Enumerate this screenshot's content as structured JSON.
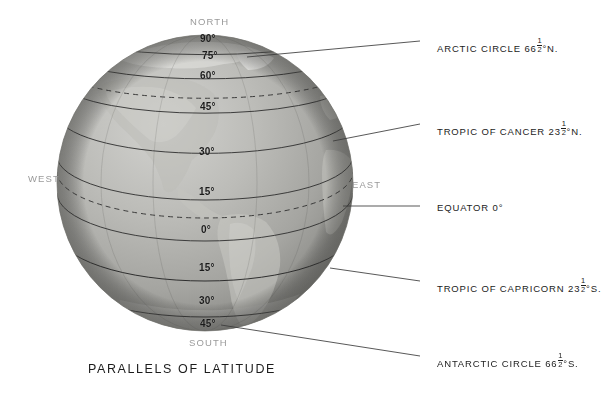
{
  "figure": {
    "caption": "PARALLELS OF LATITUDE"
  },
  "cardinals": [
    {
      "name": "north",
      "label": "NORTH",
      "x": 190,
      "y": 16
    },
    {
      "name": "south",
      "label": "SOUTH",
      "x": 189,
      "y": 337
    },
    {
      "name": "west",
      "label": "WEST",
      "x": 28,
      "y": 173
    },
    {
      "name": "east",
      "label": "EAST",
      "x": 352,
      "y": 179
    }
  ],
  "latitude_labels": [
    {
      "value": "90°",
      "x": 200,
      "y": 33,
      "hemisphere": "north"
    },
    {
      "value": "75°",
      "x": 202,
      "y": 50,
      "hemisphere": "north"
    },
    {
      "value": "60°",
      "x": 200,
      "y": 70,
      "hemisphere": "north"
    },
    {
      "value": "45°",
      "x": 200,
      "y": 101,
      "hemisphere": "north"
    },
    {
      "value": "30°",
      "x": 199,
      "y": 146,
      "hemisphere": "north"
    },
    {
      "value": "15°",
      "x": 199,
      "y": 186,
      "hemisphere": "north"
    },
    {
      "value": "0°",
      "x": 201,
      "y": 224,
      "hemisphere": "equator"
    },
    {
      "value": "15°",
      "x": 199,
      "y": 262,
      "hemisphere": "south"
    },
    {
      "value": "30°",
      "x": 199,
      "y": 295,
      "hemisphere": "south"
    },
    {
      "value": "45°",
      "x": 200,
      "y": 318,
      "hemisphere": "south"
    }
  ],
  "callouts": [
    {
      "name": "arctic-circle",
      "text_before": "ARCTIC CIRCLE 66",
      "fraction_num": "1",
      "fraction_den": "2",
      "text_after": "°N.",
      "x": 437,
      "y": 37,
      "leader": {
        "x1": 420,
        "y1": 41,
        "x2": 247,
        "y2": 57
      }
    },
    {
      "name": "tropic-of-cancer",
      "text_before": "TROPIC OF CANCER 23",
      "fraction_num": "1",
      "fraction_den": "2",
      "text_after": "°N.",
      "x": 437,
      "y": 120,
      "leader": {
        "x1": 420,
        "y1": 124,
        "x2": 333,
        "y2": 141
      }
    },
    {
      "name": "equator",
      "text_before": "EQUATOR 0°",
      "fraction_num": "",
      "fraction_den": "",
      "text_after": "",
      "x": 437,
      "y": 202,
      "leader": {
        "x1": 420,
        "y1": 206,
        "x2": 343,
        "y2": 206
      }
    },
    {
      "name": "tropic-of-capricorn",
      "text_before": "TROPIC OF CAPRICORN 23",
      "fraction_num": "1",
      "fraction_den": "2",
      "text_after": "°S.",
      "x": 437,
      "y": 277,
      "leader": {
        "x1": 420,
        "y1": 281,
        "x2": 330,
        "y2": 268
      }
    },
    {
      "name": "antarctic-circle",
      "text_before": "ANTARCTIC CIRCLE 66",
      "fraction_num": "1",
      "fraction_den": "2",
      "text_after": "°S.",
      "x": 437,
      "y": 352,
      "leader": {
        "x1": 420,
        "y1": 356,
        "x2": 221,
        "y2": 325
      }
    }
  ],
  "chart_data": {
    "type": "diagram",
    "title": "PARALLELS OF LATITUDE",
    "globe": {
      "center_x": 205,
      "center_y": 183,
      "radius": 148,
      "projection": "orthographic",
      "view": "western-hemisphere"
    },
    "parallels": [
      {
        "latitude": 90,
        "label": "90°",
        "style": "solid",
        "name": "north-pole"
      },
      {
        "latitude": 75,
        "label": "75°",
        "style": "solid",
        "name": "75-north"
      },
      {
        "latitude": 66.5,
        "label": "",
        "style": "dashed",
        "name": "arctic-circle"
      },
      {
        "latitude": 60,
        "label": "60°",
        "style": "solid",
        "name": "60-north"
      },
      {
        "latitude": 45,
        "label": "45°",
        "style": "solid",
        "name": "45-north"
      },
      {
        "latitude": 30,
        "label": "30°",
        "style": "solid",
        "name": "30-north"
      },
      {
        "latitude": 23.5,
        "label": "",
        "style": "dashed",
        "name": "tropic-of-cancer"
      },
      {
        "latitude": 15,
        "label": "15°",
        "style": "solid",
        "name": "15-north"
      },
      {
        "latitude": 0,
        "label": "0°",
        "style": "solid",
        "name": "equator"
      },
      {
        "latitude": -15,
        "label": "15°",
        "style": "solid",
        "name": "15-south"
      },
      {
        "latitude": -23.5,
        "label": "",
        "style": "dashed",
        "name": "tropic-of-capricorn"
      },
      {
        "latitude": -30,
        "label": "30°",
        "style": "solid",
        "name": "30-south"
      },
      {
        "latitude": -45,
        "label": "45°",
        "style": "solid",
        "name": "45-south"
      },
      {
        "latitude": -66.5,
        "label": "",
        "style": "dashed",
        "name": "antarctic-circle"
      }
    ]
  },
  "colors": {
    "background": "#ffffff",
    "globe_light": "#c9c9c6",
    "globe_mid": "#a8a8a4",
    "globe_dark": "#7d7d79",
    "graticule": "#2e2e2e",
    "text": "#1c1c1c",
    "cardinal_text": "#9a9a9a"
  }
}
